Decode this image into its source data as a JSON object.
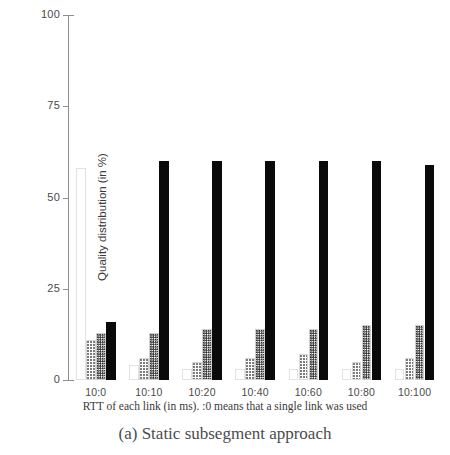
{
  "figure": {
    "caption": "(a) Static subsegment approach"
  },
  "chart_data": {
    "type": "bar",
    "title": "",
    "subtitle": "",
    "xlabel": "RTT of each link (in ms). :0 means that a single link was used",
    "ylabel": "Quality distribution (in %)",
    "categories": [
      "10:0",
      "10:10",
      "10:20",
      "10:40",
      "10:60",
      "10:80",
      "10:100"
    ],
    "ylim": [
      0,
      100
    ],
    "yticks": [
      0,
      25,
      50,
      75,
      100
    ],
    "ytick_labels": [
      "0",
      "25",
      "50",
      "75",
      "100"
    ],
    "grid": false,
    "legend": "none",
    "series": [
      {
        "name": "series-1",
        "values": [
          58,
          4,
          3,
          3,
          3,
          3,
          3
        ]
      },
      {
        "name": "series-2",
        "values": [
          11,
          6,
          5,
          6,
          7,
          5,
          6
        ]
      },
      {
        "name": "series-3",
        "values": [
          13,
          13,
          14,
          14,
          14,
          15,
          15
        ]
      },
      {
        "name": "series-4",
        "values": [
          16,
          60,
          60,
          60,
          60,
          60,
          59
        ]
      }
    ]
  },
  "axis": {
    "y_axis_name": "y-axis",
    "x_axis_name": "x-axis"
  }
}
